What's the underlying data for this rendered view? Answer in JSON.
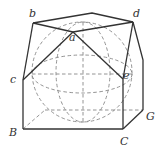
{
  "diagram": {
    "labels": {
      "a": "a",
      "b": "b",
      "c": "c",
      "d": "d",
      "e": "e",
      "B": "B",
      "C": "C",
      "G": "G"
    },
    "colors": {
      "solid_line": "#333333",
      "dashed_line": "#888888",
      "background": "#ffffff"
    }
  }
}
